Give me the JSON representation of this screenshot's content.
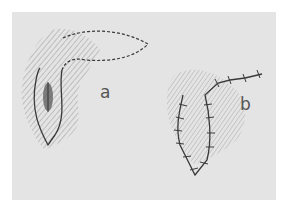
{
  "figure": {
    "labels": {
      "a": "a",
      "b": "b"
    },
    "colors": {
      "background": "#ffffff",
      "panel": "#e4e4e4",
      "ink": "#3a3a3a",
      "hatch": "#8a8a8a"
    }
  }
}
